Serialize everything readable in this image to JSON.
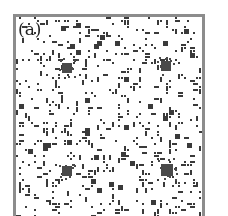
{
  "figure": {
    "panel_label": "(a)",
    "colors": {
      "background": "#ffffff",
      "border": "#8c8c8c",
      "dot": "#3a3a3a",
      "cluster": "#4a4a4a"
    },
    "lattice": {
      "cell_px": 3,
      "width_px": 186,
      "height_px": 201,
      "fill_fraction": 0.13,
      "seed": 1729
    },
    "clusters": [
      {
        "x": 51,
        "y": 51,
        "radius": 5
      },
      {
        "x": 150,
        "y": 49,
        "radius": 5
      },
      {
        "x": 51,
        "y": 154,
        "radius": 5
      },
      {
        "x": 151,
        "y": 153,
        "radius": 6
      }
    ]
  }
}
